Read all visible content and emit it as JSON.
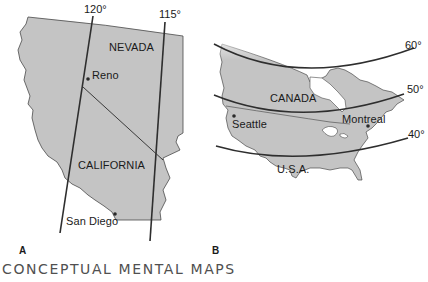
{
  "figure": {
    "caption": "CONCEPTUAL MENTAL MAPS",
    "colors": {
      "land": "#c4c4c4",
      "line": "#2e2e2e",
      "text": "#1a1a1a",
      "caption": "#505050",
      "background": "#ffffff"
    },
    "panels": [
      {
        "id": "A",
        "label": "A",
        "regions": [
          "NEVADA",
          "CALIFORNIA"
        ],
        "cities": [
          "Reno",
          "San Diego"
        ],
        "meridians": [
          "120°",
          "115°"
        ]
      },
      {
        "id": "B",
        "label": "B",
        "regions": [
          "CANADA",
          "U.S.A."
        ],
        "cities": [
          "Seattle",
          "Montreal"
        ],
        "parallels": [
          "60°",
          "50°",
          "40°"
        ]
      }
    ]
  }
}
